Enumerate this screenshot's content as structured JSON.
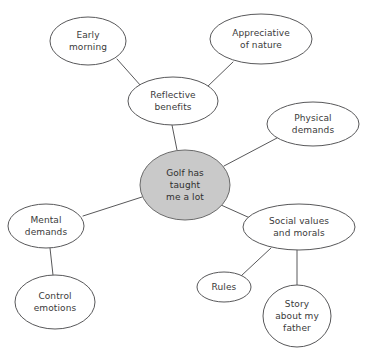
{
  "diagram": {
    "type": "mind-map",
    "canvas": {
      "width": 366,
      "height": 357
    },
    "colors": {
      "central_fill": "#c9c9c9",
      "node_fill": "#ffffff",
      "stroke": "#58585a",
      "text": "#3a3a3a",
      "background": "#ffffff"
    },
    "nodes": [
      {
        "id": "central",
        "role": "central",
        "label": "Golf has taught me a lot",
        "lines": [
          "Golf has",
          "taught",
          "me a lot"
        ],
        "cx": 185,
        "cy": 185,
        "rx": 45,
        "ry": 35
      },
      {
        "id": "reflective-benefits",
        "role": "branch",
        "label": "Reflective benefits",
        "lines": [
          "Reflective",
          "benefits"
        ],
        "cx": 173,
        "cy": 101,
        "rx": 45,
        "ry": 24
      },
      {
        "id": "early-morning",
        "role": "leaf",
        "label": "Early morning",
        "lines": [
          "Early",
          "morning"
        ],
        "cx": 88,
        "cy": 41,
        "rx": 38,
        "ry": 24
      },
      {
        "id": "appreciative-of-nature",
        "role": "leaf",
        "label": "Appreciative of nature",
        "lines": [
          "Appreciative",
          "of nature"
        ],
        "cx": 261,
        "cy": 39,
        "rx": 51,
        "ry": 25
      },
      {
        "id": "physical-demands",
        "role": "branch",
        "label": "Physical demands",
        "lines": [
          "Physical",
          "demands"
        ],
        "cx": 313,
        "cy": 124,
        "rx": 46,
        "ry": 22
      },
      {
        "id": "mental-demands",
        "role": "branch",
        "label": "Mental demands",
        "lines": [
          "Mental",
          "demands"
        ],
        "cx": 46,
        "cy": 226,
        "rx": 38,
        "ry": 22
      },
      {
        "id": "control-emotions",
        "role": "leaf",
        "label": "Control emotions",
        "lines": [
          "Control",
          "emotions"
        ],
        "cx": 55,
        "cy": 302,
        "rx": 40,
        "ry": 27
      },
      {
        "id": "social-values-and-morals",
        "role": "branch",
        "label": "Social values and morals",
        "lines": [
          "Social values",
          "and morals"
        ],
        "cx": 299,
        "cy": 227,
        "rx": 56,
        "ry": 23
      },
      {
        "id": "rules",
        "role": "leaf",
        "label": "Rules",
        "lines": [
          "Rules"
        ],
        "cx": 224,
        "cy": 287,
        "rx": 27,
        "ry": 15
      },
      {
        "id": "story-about-my-father",
        "role": "leaf",
        "label": "Story about my father",
        "lines": [
          "Story",
          "about my",
          "father"
        ],
        "cx": 297,
        "cy": 316,
        "rx": 34,
        "ry": 31
      }
    ],
    "edges": [
      {
        "id": "edge-central-reflective",
        "from": "central",
        "to": "reflective-benefits",
        "x1": 177,
        "y1": 150,
        "x2": 172,
        "y2": 125
      },
      {
        "id": "edge-central-physical",
        "from": "central",
        "to": "physical-demands",
        "x1": 224,
        "y1": 166,
        "x2": 277,
        "y2": 138
      },
      {
        "id": "edge-central-mental",
        "from": "central",
        "to": "mental-demands",
        "x1": 142,
        "y1": 197,
        "x2": 83,
        "y2": 216
      },
      {
        "id": "edge-central-social",
        "from": "central",
        "to": "social-values-and-morals",
        "x1": 221,
        "y1": 205,
        "x2": 250,
        "y2": 218
      },
      {
        "id": "edge-reflective-early",
        "from": "reflective-benefits",
        "to": "early-morning",
        "x1": 141,
        "y1": 86,
        "x2": 117,
        "y2": 59
      },
      {
        "id": "edge-reflective-appreciative",
        "from": "reflective-benefits",
        "to": "appreciative-of-nature",
        "x1": 206,
        "y1": 88,
        "x2": 233,
        "y2": 62
      },
      {
        "id": "edge-mental-control",
        "from": "mental-demands",
        "to": "control-emotions",
        "x1": 50,
        "y1": 248,
        "x2": 53,
        "y2": 275
      },
      {
        "id": "edge-social-rules",
        "from": "social-values-and-morals",
        "to": "rules",
        "x1": 271,
        "y1": 248,
        "x2": 241,
        "y2": 276
      },
      {
        "id": "edge-social-story",
        "from": "social-values-and-morals",
        "to": "story-about-my-father",
        "x1": 297,
        "y1": 250,
        "x2": 297,
        "y2": 285
      }
    ]
  }
}
